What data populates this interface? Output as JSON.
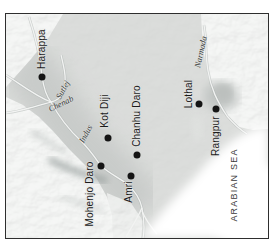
{
  "map": {
    "description": "Indus Valley civilization sites map (rotated 90 degrees, labels read bottom-to-top)",
    "frame": {
      "left": 5,
      "top": 13,
      "width": 262,
      "height": 224
    },
    "sites": [
      {
        "name": "Harappa",
        "dot": {
          "x": 41,
          "y": 75.5
        },
        "label": {
          "x": 41,
          "y": 47.5,
          "rotation": -90
        }
      },
      {
        "name": "Kot Diji",
        "dot": {
          "x": 106.5,
          "y": 136.5
        },
        "label": {
          "x": 103.5,
          "y": 110,
          "rotation": -90
        }
      },
      {
        "name": "Chanhu Daro",
        "dot": {
          "x": 136,
          "y": 154
        },
        "label": {
          "x": 136,
          "y": 115,
          "rotation": -90
        }
      },
      {
        "name": "Mohenjo Daro",
        "dot": {
          "x": 100,
          "y": 165
        },
        "label": {
          "x": 89,
          "y": 193,
          "rotation": -90
        }
      },
      {
        "name": "Amri",
        "dot": {
          "x": 130,
          "y": 175
        },
        "label": {
          "x": 128,
          "y": 191,
          "rotation": -90
        }
      },
      {
        "name": "Lothal",
        "dot": {
          "x": 198,
          "y": 103
        },
        "label": {
          "x": 188,
          "y": 93,
          "rotation": -90
        }
      },
      {
        "name": "Rangpur",
        "dot": {
          "x": 215,
          "y": 108
        },
        "label": {
          "x": 215,
          "y": 135,
          "rotation": -90
        }
      }
    ],
    "rivers": [
      {
        "name": "Chenab",
        "label": {
          "x": 60,
          "y": 103,
          "rotation": -26
        }
      },
      {
        "name": "Sutlej",
        "label": {
          "x": 62,
          "y": 88.5,
          "rotation": -61
        }
      },
      {
        "name": "Indus",
        "label": {
          "x": 85,
          "y": 133,
          "rotation": -62
        }
      },
      {
        "name": "Narmada",
        "label": {
          "x": 200,
          "y": 50.5,
          "rotation": -78
        }
      }
    ],
    "sea": {
      "label": "ARABIAN SEA",
      "x": 233,
      "y": 184,
      "rotation": -90
    },
    "colors": {
      "land": "#d4d6d4",
      "valley_wash": "#c6c9c7",
      "mountain_shade": "#b9bfbd",
      "river": "#f2f3f2",
      "sea": "#ffffff",
      "dot": "#151515",
      "frame_border": "#2e2e2e",
      "site_text": "#1b1b1b",
      "river_text": "#3c3e3c",
      "sea_text": "#3a3a3a"
    }
  }
}
